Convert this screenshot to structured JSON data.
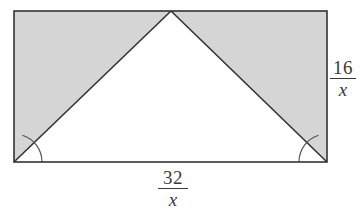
{
  "figure": {
    "background_color": "#ffffff",
    "stroke_color": "#333333",
    "shaded_fill": "#d5d5d5",
    "unshaded_fill": "#ffffff",
    "rectangle": {
      "left": 14,
      "top": 11,
      "right": 327,
      "bottom": 162,
      "width": 313,
      "height": 151
    },
    "triangle": {
      "apex": {
        "x": 171,
        "y": 11
      },
      "bottom_left": {
        "x": 14,
        "y": 162
      },
      "bottom_right": {
        "x": 327,
        "y": 162
      },
      "fill": "#ffffff"
    },
    "shaded_regions": [
      {
        "name": "left-shaded-triangle",
        "points": "14,11 171,11 14,162"
      },
      {
        "name": "right-shaded-triangle",
        "points": "171,11 327,11 327,162"
      }
    ],
    "angle_arcs": [
      {
        "name": "bottom-left-angle-arc",
        "vertex": {
          "x": 14,
          "y": 162
        },
        "radius": 28
      },
      {
        "name": "bottom-right-angle-arc",
        "vertex": {
          "x": 327,
          "y": 162
        },
        "radius": 28
      }
    ],
    "labels": {
      "height": {
        "name": "height-label",
        "numerator": "16",
        "denominator": "x",
        "position": "right-side"
      },
      "base": {
        "name": "base-label",
        "numerator": "32",
        "denominator": "x",
        "position": "bottom-center"
      }
    }
  }
}
